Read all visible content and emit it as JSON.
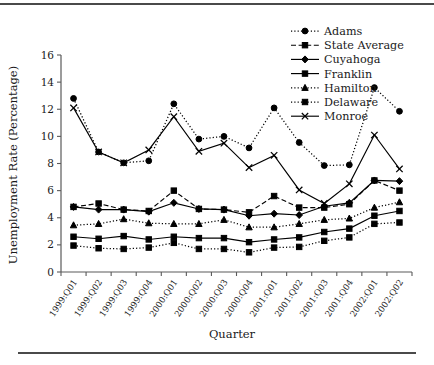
{
  "figure": {
    "xlabel": "Quarter",
    "ylabel": "Unemployment Rate (Percentage)"
  },
  "axis": {
    "yticks": [
      "0",
      "2",
      "4",
      "6",
      "8",
      "10",
      "12",
      "14",
      "16"
    ],
    "xticks": [
      "1999:Q01",
      "1999:Q02",
      "1999:Q03",
      "1999:Q04",
      "2000:Q01",
      "2000:Q02",
      "2000:Q03",
      "2000:Q04",
      "2001:Q01",
      "2001:Q02",
      "2001:Q03",
      "2001:Q04",
      "2002:Q01",
      "2002:Q02"
    ]
  },
  "legend": {
    "items": [
      {
        "label": "Adams",
        "marker": "circle",
        "line": "dotted"
      },
      {
        "label": "State Average",
        "marker": "square",
        "line": "dashed"
      },
      {
        "label": "Cuyahoga",
        "marker": "diamond",
        "line": "solid"
      },
      {
        "label": "Franklin",
        "marker": "square",
        "line": "solid"
      },
      {
        "label": "Hamilton",
        "marker": "triangle",
        "line": "dotted"
      },
      {
        "label": "Delaware",
        "marker": "square",
        "line": "dotted"
      },
      {
        "label": "Monroe",
        "marker": "x",
        "line": "solid"
      }
    ]
  },
  "chart_data": {
    "type": "line",
    "title": "",
    "xlabel": "Quarter",
    "ylabel": "Unemployment Rate (Percentage)",
    "ylim": [
      0,
      16
    ],
    "ytick_step": 2,
    "grid": false,
    "legend_position": "top-right",
    "categories": [
      "1999:Q01",
      "1999:Q02",
      "1999:Q03",
      "1999:Q04",
      "2000:Q01",
      "2000:Q02",
      "2000:Q03",
      "2000:Q04",
      "2001:Q01",
      "2001:Q02",
      "2001:Q03",
      "2001:Q04",
      "2002:Q01",
      "2002:Q02"
    ],
    "series": [
      {
        "name": "Adams",
        "marker": "circle",
        "line": "dotted",
        "values": [
          12.8,
          8.85,
          8.05,
          8.2,
          12.4,
          9.8,
          10.0,
          9.15,
          12.1,
          9.55,
          7.85,
          7.9,
          13.6,
          11.85
        ]
      },
      {
        "name": "State Average",
        "marker": "square",
        "line": "dashed",
        "values": [
          4.8,
          5.05,
          4.6,
          4.5,
          6.0,
          4.65,
          4.6,
          4.4,
          5.6,
          4.75,
          4.75,
          5.0,
          6.75,
          6.0
        ]
      },
      {
        "name": "Cuyahoga",
        "marker": "diamond",
        "line": "solid",
        "values": [
          4.8,
          4.6,
          4.6,
          4.45,
          5.1,
          4.65,
          4.6,
          4.15,
          4.3,
          4.2,
          4.85,
          5.1,
          6.75,
          6.7
        ]
      },
      {
        "name": "Franklin",
        "marker": "square",
        "line": "solid",
        "values": [
          2.6,
          2.45,
          2.65,
          2.4,
          2.6,
          2.5,
          2.5,
          2.2,
          2.4,
          2.55,
          2.95,
          3.2,
          4.15,
          4.5
        ]
      },
      {
        "name": "Hamilton",
        "marker": "triangle",
        "line": "dotted",
        "values": [
          3.45,
          3.55,
          3.9,
          3.6,
          3.55,
          3.55,
          3.85,
          3.3,
          3.3,
          3.55,
          3.85,
          3.95,
          4.75,
          5.15
        ]
      },
      {
        "name": "Delaware",
        "marker": "square",
        "line": "dotted",
        "values": [
          1.95,
          1.75,
          1.7,
          1.8,
          2.15,
          1.7,
          1.7,
          1.45,
          1.8,
          1.85,
          2.3,
          2.55,
          3.55,
          3.65
        ]
      },
      {
        "name": "Monroe",
        "marker": "x",
        "line": "solid",
        "values": [
          12.1,
          8.85,
          8.05,
          9.0,
          11.45,
          8.9,
          9.5,
          7.7,
          8.6,
          6.05,
          5.05,
          6.5,
          10.1,
          7.6
        ]
      }
    ]
  }
}
